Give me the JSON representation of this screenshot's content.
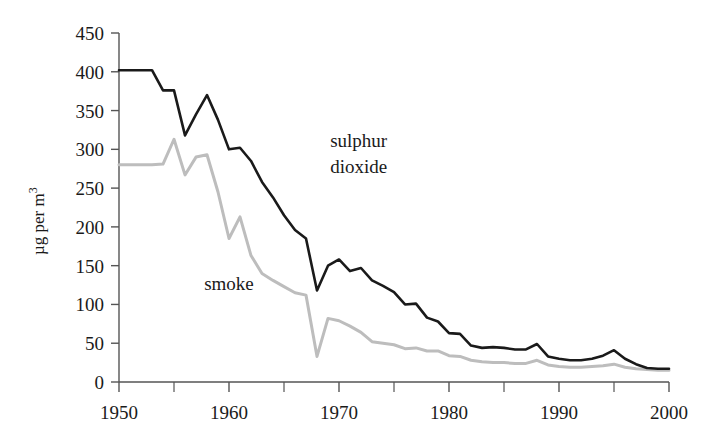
{
  "chart_data": {
    "type": "line",
    "title": "",
    "xlabel": "",
    "ylabel": "µg per m",
    "ylabel_sup": "3",
    "xlim": [
      1950,
      2000
    ],
    "ylim": [
      0,
      450
    ],
    "grid": false,
    "legend": "inline-annotations",
    "y_ticks": [
      0,
      50,
      100,
      150,
      200,
      250,
      300,
      350,
      400,
      450
    ],
    "y_tick_labels": [
      "0",
      "50",
      "100",
      "150",
      "200",
      "250",
      "300",
      "350",
      "400",
      "450"
    ],
    "x_ticks": [
      1950,
      1960,
      1970,
      1980,
      1990,
      2000
    ],
    "x_tick_labels": [
      "1950",
      "1960",
      "1970",
      "1980",
      "1990",
      "2000"
    ],
    "x_minor_ticks": [
      1955,
      1965,
      1975,
      1985,
      1995
    ],
    "x": [
      1950,
      1951,
      1952,
      1953,
      1954,
      1955,
      1956,
      1957,
      1958,
      1959,
      1960,
      1961,
      1962,
      1963,
      1964,
      1965,
      1966,
      1967,
      1968,
      1969,
      1970,
      1971,
      1972,
      1973,
      1974,
      1975,
      1976,
      1977,
      1978,
      1979,
      1980,
      1981,
      1982,
      1983,
      1984,
      1985,
      1986,
      1987,
      1988,
      1989,
      1990,
      1991,
      1992,
      1993,
      1994,
      1995,
      1996,
      1997,
      1998,
      1999,
      2000
    ],
    "series": [
      {
        "name": "sulphur dioxide",
        "color": "#1a1a1a",
        "label_lines": [
          "sulphur",
          "dioxide"
        ],
        "values": [
          402,
          402,
          402,
          402,
          376,
          376,
          318,
          345,
          370,
          338,
          300,
          302,
          285,
          258,
          238,
          215,
          196,
          185,
          118,
          150,
          158,
          143,
          147,
          131,
          124,
          116,
          100,
          101,
          83,
          78,
          63,
          62,
          47,
          44,
          45,
          44,
          42,
          42,
          49,
          33,
          30,
          28,
          28,
          30,
          34,
          41,
          30,
          23,
          18,
          17,
          17
        ]
      },
      {
        "name": "smoke",
        "color": "#bdbdbd",
        "label_lines": [
          "smoke"
        ],
        "values": [
          280,
          280,
          280,
          280,
          281,
          313,
          267,
          290,
          293,
          245,
          185,
          213,
          163,
          140,
          131,
          123,
          115,
          112,
          33,
          82,
          79,
          72,
          64,
          52,
          50,
          48,
          43,
          44,
          40,
          40,
          34,
          33,
          28,
          26,
          25,
          25,
          24,
          24,
          28,
          22,
          20,
          19,
          19,
          20,
          21,
          23,
          19,
          17,
          16,
          15,
          15
        ]
      }
    ]
  },
  "annotations": {
    "sulphur_dioxide": {
      "lines": [
        "sulphur",
        "dioxide"
      ],
      "x": 1970,
      "y": 300
    },
    "smoke": {
      "lines": [
        "smoke"
      ],
      "x": 1961,
      "y": 120
    }
  }
}
